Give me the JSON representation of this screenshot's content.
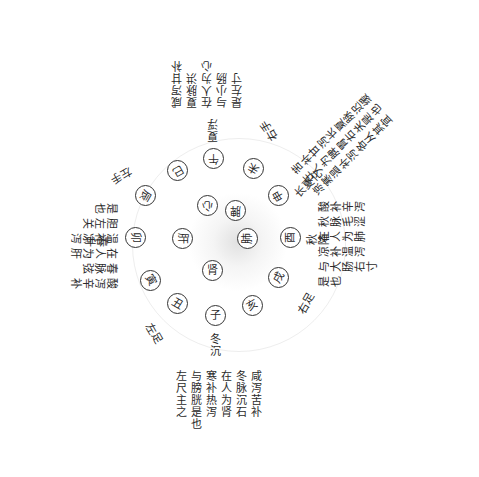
{
  "diagram": {
    "type": "radial-correspondence-chart",
    "center_glow_color": "#d0d0d0",
    "inner_organs": [
      {
        "id": "heart",
        "label": "心"
      },
      {
        "id": "spleen",
        "label": "脾"
      },
      {
        "id": "lung",
        "label": "肺"
      },
      {
        "id": "kidney",
        "label": "肾"
      },
      {
        "id": "liver",
        "label": "肝"
      }
    ],
    "branches": [
      {
        "id": "si",
        "label": "巳"
      },
      {
        "id": "wu",
        "label": "午"
      },
      {
        "id": "wei",
        "label": "未"
      },
      {
        "id": "shen",
        "label": "申"
      },
      {
        "id": "you",
        "label": "酉"
      },
      {
        "id": "xu",
        "label": "戌"
      },
      {
        "id": "hai",
        "label": "亥"
      },
      {
        "id": "zi",
        "label": "子"
      },
      {
        "id": "chou",
        "label": "丑"
      },
      {
        "id": "yin",
        "label": "寅"
      },
      {
        "id": "mao",
        "label": "卯"
      },
      {
        "id": "chen",
        "label": "辰"
      }
    ],
    "labels": {
      "left_hand": "左手",
      "summer_float": "夏浮",
      "right_hand": "右手",
      "long_summer_transform": "长夏化",
      "autumn_descend": "秋降",
      "right_foot": "右足",
      "winter_sink": "冬沉",
      "left_foot": "左足",
      "spring_rise": "春升"
    },
    "notes": {
      "summer": [
        "咸泻甘补",
        "夏脉洪",
        "在人为心",
        "小肠与",
        "左寸是也"
      ],
      "summer_lines": "咸泻甘补\n夏脉洪\n在人为心\n与小肠\n是左寸",
      "long_summer_lines": "苦补甘泻长夏脉迟缓\n在人为脾胃右关是也\n凉寒温补泻各从其宜",
      "autumn_lines": "酸补辛泻\n秋脉毛涩\n在人为肺\n凉补温泻\n与大肠右寸\n是也",
      "spring_lines": "酸泻辛补\n春脉弦\n在人为肝\n温补凉泻\n胆左关\n是也",
      "winter_lines": "咸泻苦补\n冬脉沉石\n在人为肾\n寒补热泻\n与膀胱是也\n左尺主之"
    }
  }
}
